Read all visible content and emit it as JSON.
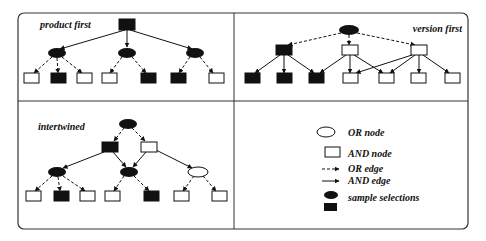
{
  "panels": {
    "product_first": {
      "label": "product first"
    },
    "version_first": {
      "label": "version first"
    },
    "intertwined": {
      "label": "intertwined"
    }
  },
  "legend": {
    "or_node": "OR node",
    "and_node": "AND node",
    "or_edge": "OR edge",
    "and_edge": "AND edge",
    "sample_selections": "sample selections"
  },
  "colors": {
    "ink": "#111111",
    "fill_selected": "#111111",
    "fill_unselected": "#ffffff",
    "frame": "#333333"
  }
}
